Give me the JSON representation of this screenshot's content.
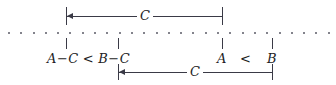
{
  "figure": {
    "type": "number-line-diagram",
    "ink_color": "#3a3a46",
    "text_color": "#1d1d24",
    "axis": {
      "name": "dotted-number-line",
      "dot_count": 27
    },
    "top_measure": {
      "label": "C",
      "left_tick_x": 66,
      "right_tick_x": 222,
      "arrow_direction": "left"
    },
    "bottom_measure": {
      "label": "C",
      "left_tick_x": 118,
      "right_tick_x": 272,
      "arrow_direction": "left"
    },
    "left_expression": {
      "minuend_a": "A",
      "minus_1": "−",
      "subtrahend_c1": "C",
      "relation": "<",
      "minuend_b": "B",
      "minus_2": "−",
      "subtrahend_c2": "C"
    },
    "right_expression": {
      "point_a": "A",
      "relation": "<",
      "point_b": "B"
    }
  }
}
